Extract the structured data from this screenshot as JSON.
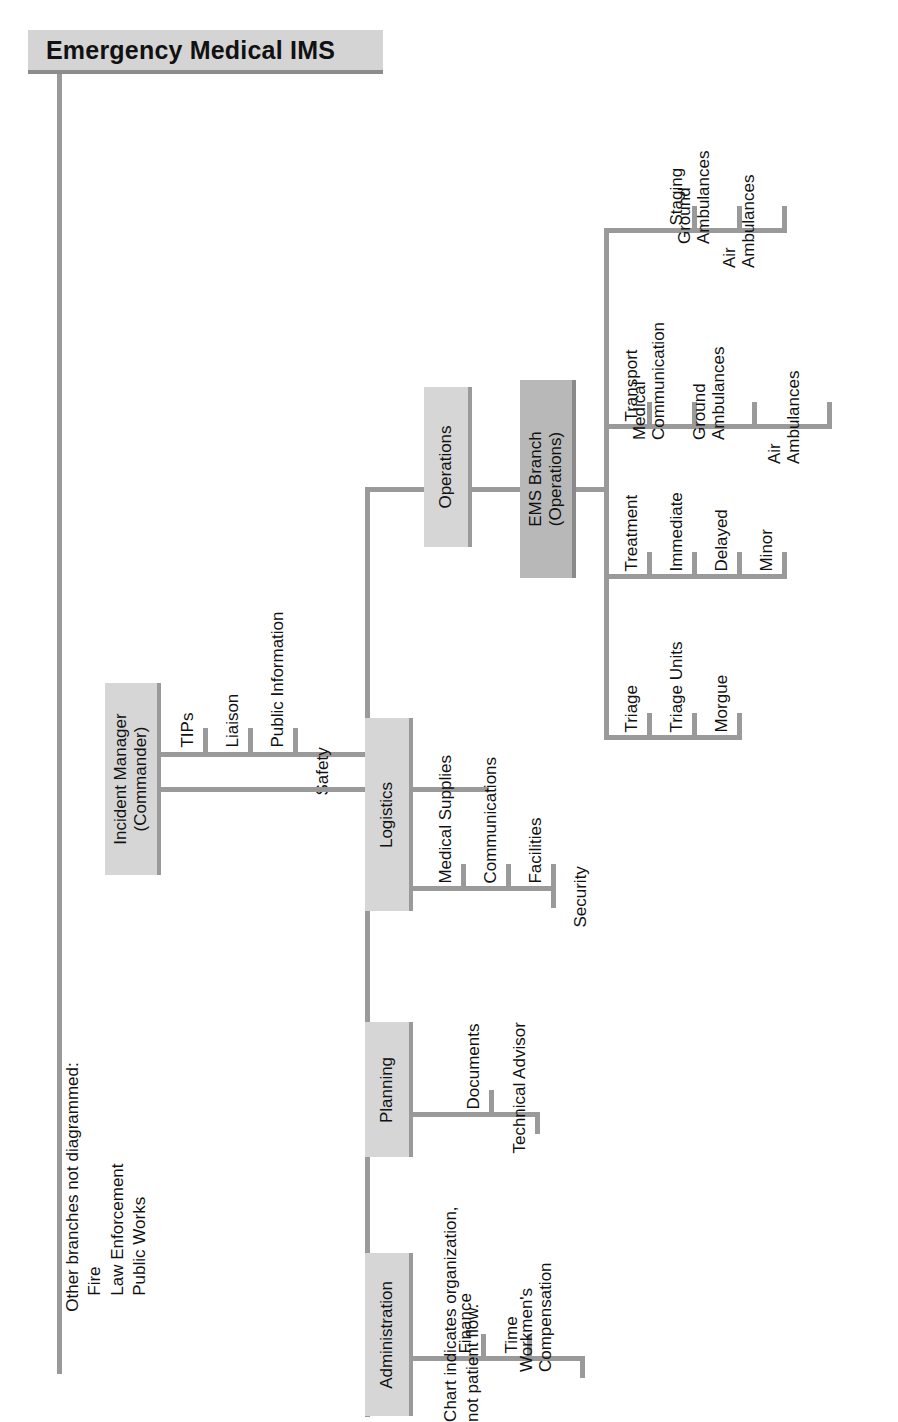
{
  "title": {
    "text": "Emergency Medical IMS"
  },
  "command": {
    "label": "Incident Manager\n(Commander)",
    "label_line1": "Incident Manager",
    "label_line2": "(Commander)",
    "staff": [
      {
        "label": "TIPs"
      },
      {
        "label": "Liaison"
      },
      {
        "label": "Public Information"
      },
      {
        "label": "Safety"
      }
    ]
  },
  "sections": [
    {
      "label": "Administration",
      "children": [
        {
          "label": "Finance"
        },
        {
          "label": "Time"
        },
        {
          "label": "Workmen's",
          "label2": "Compensation"
        }
      ]
    },
    {
      "label": "Planning",
      "children": [
        {
          "label": "Documents"
        },
        {
          "label": "Technical Advisor"
        }
      ]
    },
    {
      "label": "Logistics",
      "children": [
        {
          "label": "Medical Supplies"
        },
        {
          "label": "Communications"
        },
        {
          "label": "Facilities"
        },
        {
          "label": "Security"
        }
      ]
    },
    {
      "label": "Operations",
      "children": []
    }
  ],
  "ems_branch": {
    "label_line1": "EMS Branch",
    "label_line2": "(Operations)",
    "groups": [
      {
        "head": "Triage",
        "children": [
          {
            "label": "Triage Units"
          },
          {
            "label": "Morgue"
          }
        ]
      },
      {
        "head": "Treatment",
        "children": [
          {
            "label": "Immediate"
          },
          {
            "label": "Delayed"
          },
          {
            "label": "Minor"
          }
        ]
      },
      {
        "head": "Transport",
        "children": [
          {
            "label": "Medical",
            "label2": "Communication"
          },
          {
            "label": "Ground",
            "label2": "Ambulances"
          },
          {
            "label": "Air",
            "label2": "Ambulances"
          }
        ]
      },
      {
        "head": "Staging",
        "children": [
          {
            "label": "Ground",
            "label2": "Ambulances"
          },
          {
            "label": "Air",
            "label2": "Ambulances"
          }
        ]
      }
    ]
  },
  "notes": {
    "other_branches": {
      "heading": "Other branches not diagrammed:",
      "items": [
        "Fire",
        "Law Enforcement",
        "Public Works"
      ]
    },
    "flow_note": {
      "line1": "Chart indicates organization,",
      "line2": "not patient flow."
    }
  },
  "colors": {
    "box_fill": "#d6d6d6",
    "box_dark_fill": "#b8b8b8",
    "connector": "#9a9a9a",
    "text": "#111111",
    "background": "#ffffff"
  }
}
